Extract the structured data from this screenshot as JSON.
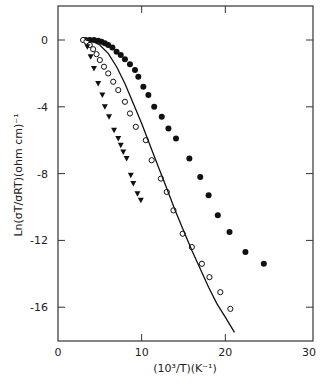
{
  "chart_data": {
    "type": "scatter",
    "title": "",
    "xlabel": "(10³/T)(K⁻¹)",
    "ylabel": "Ln(σT/σRT)(ohm cm)⁻¹",
    "xlim": [
      0,
      30
    ],
    "ylim": [
      -18.1,
      2.0
    ],
    "xticks": [
      0,
      10,
      20,
      30
    ],
    "yticks": [
      0,
      -4,
      -8,
      -12,
      -16
    ],
    "grid": false,
    "legend": null,
    "series": [
      {
        "name": "filled circles",
        "marker": "filled-circle",
        "points": [
          [
            3.3,
            0.0
          ],
          [
            3.8,
            0.0
          ],
          [
            4.3,
            0.0
          ],
          [
            4.8,
            -0.05
          ],
          [
            5.2,
            -0.1
          ],
          [
            5.6,
            -0.2
          ],
          [
            6.0,
            -0.3
          ],
          [
            6.5,
            -0.45
          ],
          [
            7.0,
            -0.7
          ],
          [
            7.5,
            -0.9
          ],
          [
            8.0,
            -1.15
          ],
          [
            8.6,
            -1.45
          ],
          [
            9.2,
            -1.8
          ],
          [
            9.6,
            -2.2
          ],
          [
            10.2,
            -2.8
          ],
          [
            10.8,
            -3.3
          ],
          [
            11.5,
            -4.0
          ],
          [
            12.4,
            -4.6
          ],
          [
            13.2,
            -5.3
          ],
          [
            14.1,
            -5.9
          ],
          [
            15.7,
            -7.1
          ],
          [
            17.0,
            -8.2
          ],
          [
            18.0,
            -9.3
          ],
          [
            19.1,
            -10.5
          ],
          [
            20.5,
            -11.5
          ],
          [
            22.4,
            -12.7
          ],
          [
            24.6,
            -13.4
          ]
        ]
      },
      {
        "name": "open circles",
        "marker": "open-circle",
        "points": [
          [
            3.0,
            0.0
          ],
          [
            3.4,
            -0.1
          ],
          [
            3.8,
            -0.3
          ],
          [
            4.2,
            -0.55
          ],
          [
            4.6,
            -0.85
          ],
          [
            5.0,
            -1.2
          ],
          [
            5.5,
            -1.6
          ],
          [
            6.0,
            -2.0
          ],
          [
            6.6,
            -2.5
          ],
          [
            7.2,
            -3.0
          ],
          [
            8.0,
            -3.7
          ],
          [
            8.6,
            -4.4
          ],
          [
            9.3,
            -5.2
          ],
          [
            10.5,
            -6.0
          ],
          [
            11.2,
            -7.2
          ],
          [
            12.3,
            -8.3
          ],
          [
            13.0,
            -9.1
          ],
          [
            13.8,
            -10.2
          ],
          [
            14.9,
            -11.6
          ],
          [
            16.0,
            -12.4
          ],
          [
            17.2,
            -13.4
          ],
          [
            18.1,
            -14.2
          ],
          [
            19.4,
            -15.1
          ],
          [
            20.6,
            -16.1
          ]
        ]
      },
      {
        "name": "filled triangles",
        "marker": "filled-triangle-down",
        "points": [
          [
            3.5,
            -0.4
          ],
          [
            3.9,
            -1.0
          ],
          [
            4.3,
            -1.7
          ],
          [
            4.8,
            -2.6
          ],
          [
            5.3,
            -3.3
          ],
          [
            5.6,
            -4.0
          ],
          [
            6.1,
            -4.6
          ],
          [
            6.7,
            -5.4
          ],
          [
            7.2,
            -5.9
          ],
          [
            7.5,
            -6.3
          ],
          [
            7.8,
            -6.7
          ],
          [
            8.2,
            -7.1
          ],
          [
            8.7,
            -8.1
          ],
          [
            9.0,
            -8.6
          ],
          [
            9.5,
            -9.2
          ],
          [
            9.9,
            -9.6
          ]
        ]
      },
      {
        "name": "theory curve",
        "marker": "line",
        "points": [
          [
            3.3,
            0.0
          ],
          [
            4.0,
            -0.05
          ],
          [
            5.0,
            -0.3
          ],
          [
            6.0,
            -0.8
          ],
          [
            7.0,
            -1.6
          ],
          [
            8.0,
            -2.6
          ],
          [
            9.0,
            -3.8
          ],
          [
            10.0,
            -5.0
          ],
          [
            11.0,
            -6.3
          ],
          [
            12.0,
            -7.6
          ],
          [
            13.0,
            -8.9
          ],
          [
            14.0,
            -10.2
          ],
          [
            15.0,
            -11.4
          ],
          [
            16.0,
            -12.6
          ],
          [
            17.0,
            -13.7
          ],
          [
            18.0,
            -14.8
          ],
          [
            19.0,
            -15.8
          ],
          [
            20.0,
            -16.6
          ],
          [
            21.1,
            -17.5
          ]
        ]
      }
    ]
  },
  "axes": {
    "x_tick_labels": [
      "0",
      "10",
      "20",
      "30"
    ],
    "y_tick_labels": [
      "0",
      "-4",
      "-8",
      "-12",
      "-16"
    ],
    "xlabel": "(10³/T)(K⁻¹)",
    "ylabel": "Ln(σT/σRT)(ohm cm)⁻¹"
  }
}
